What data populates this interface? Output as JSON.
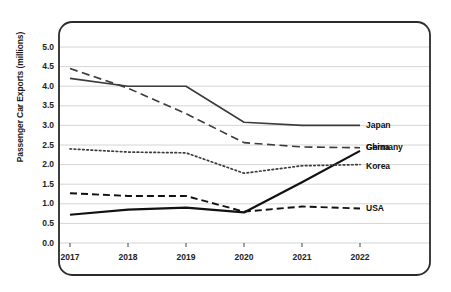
{
  "chart_data": {
    "type": "line",
    "title": "",
    "xlabel": "",
    "ylabel": "Passenger Car Exports (millions)",
    "categories": [
      "2017",
      "2018",
      "2019",
      "2020",
      "2021",
      "2022"
    ],
    "x": [
      2017,
      2018,
      2019,
      2020,
      2021,
      2022
    ],
    "ylim": [
      0.0,
      5.0
    ],
    "xlim": [
      2016.6,
      2022.4
    ],
    "yticks": [
      "0.0",
      "0.5",
      "1.0",
      "1.5",
      "2.0",
      "2.5",
      "3.0",
      "3.5",
      "4.0",
      "4.5",
      "5.0"
    ],
    "ytick_values": [
      0.0,
      0.5,
      1.0,
      1.5,
      2.0,
      2.5,
      3.0,
      3.5,
      4.0,
      4.5,
      5.0
    ],
    "grid": "horizontal",
    "legend_position": "right-inline-labels",
    "series": [
      {
        "name": "Japan",
        "style": "solid",
        "color": "#3c3c3c",
        "width": 1.6,
        "values": [
          4.2,
          4.0,
          4.0,
          3.08,
          3.0,
          3.0
        ]
      },
      {
        "name": "Germany",
        "style": "dashed",
        "color": "#3c3c3c",
        "width": 1.6,
        "values": [
          4.45,
          3.95,
          3.3,
          2.56,
          2.45,
          2.43
        ]
      },
      {
        "name": "China",
        "style": "solid",
        "color": "#111111",
        "width": 2.2,
        "values": [
          0.72,
          0.85,
          0.9,
          0.78,
          1.55,
          2.35
        ]
      },
      {
        "name": "Korea",
        "style": "dotted",
        "color": "#3c3c3c",
        "width": 1.7,
        "values": [
          2.4,
          2.32,
          2.3,
          1.78,
          1.97,
          2.0
        ]
      },
      {
        "name": "USA",
        "style": "dashed",
        "color": "#111111",
        "width": 1.9,
        "values": [
          1.27,
          1.2,
          1.2,
          0.8,
          0.93,
          0.88
        ]
      }
    ]
  },
  "axis": {
    "ylabel": "Passenger Car Exports (millions)",
    "yticks": [
      "5.0",
      "4.5",
      "4.0",
      "3.5",
      "3.0",
      "2.5",
      "2.0",
      "1.5",
      "1.0",
      "0.5",
      "0.0"
    ],
    "xticks": [
      "2017",
      "2018",
      "2019",
      "2020",
      "2021",
      "2022"
    ]
  },
  "legend": {
    "items": [
      {
        "label": "Japan"
      },
      {
        "label": "Germany"
      },
      {
        "label": "China"
      },
      {
        "label": "Korea"
      },
      {
        "label": "USA"
      }
    ]
  },
  "colors": {
    "frame": "#2b2b2b",
    "grid": "#c9c9c9",
    "text": "#111111",
    "background": "#ffffff"
  }
}
